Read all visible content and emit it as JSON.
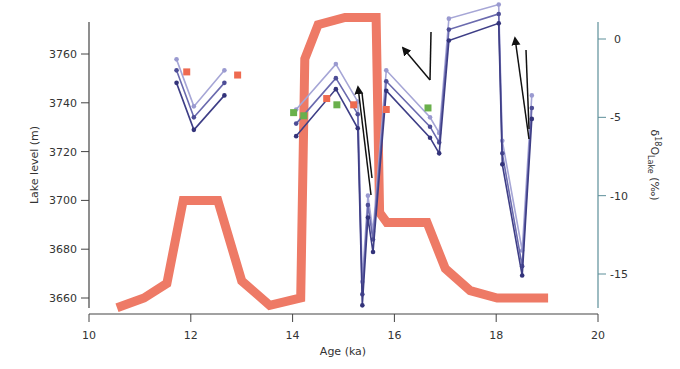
{
  "chart_data": {
    "type": "line",
    "title": "",
    "xlabel": "Age (ka)",
    "ylabel_left": "Lake level (m)",
    "ylabel_right": "δ18O_Lake (‰)",
    "ylabel_right_parts": {
      "delta": "δ",
      "sup": "18",
      "main": "O",
      "sub": "Lake",
      "unit": " (‰)"
    },
    "xlim": [
      10,
      20
    ],
    "ylim_left": [
      3652,
      3774
    ],
    "ylim_right": [
      -17.5,
      1.2
    ],
    "grid": false,
    "x_ticks": [
      10,
      12,
      14,
      16,
      18,
      20
    ],
    "y_ticks_left": [
      3660,
      3680,
      3700,
      3720,
      3740,
      3760
    ],
    "y_ticks_right": [
      0,
      -5,
      -10,
      -15
    ],
    "colors": {
      "lake_level": "#ee7a66",
      "model_light": "#a6a6d6",
      "model_mid": "#6a6aae",
      "model_dark": "#3e3e86",
      "obs_red": "#ee6a50",
      "obs_green": "#6ab04c",
      "arrow": "#111111",
      "axis": "#444444",
      "right_axis": "#5d8f99"
    },
    "series": [
      {
        "name": "Lake level",
        "axis": "left",
        "style": "thick-line",
        "x": [
          10.55,
          11.08,
          11.53,
          11.85,
          12.53,
          13.0,
          13.55,
          14.16,
          14.24,
          14.5,
          15.03,
          15.64,
          15.71,
          15.85,
          16.64,
          17.0,
          17.49,
          18.02,
          19.02
        ],
        "values": [
          3656,
          3660,
          3666,
          3700,
          3700,
          3667,
          3657,
          3660,
          3758,
          3772,
          3775,
          3775,
          3695,
          3691,
          3691,
          3672,
          3663,
          3660,
          3660
        ]
      },
      {
        "name": "Modeled δ18O (scenario A, light)",
        "axis": "right",
        "style": "line-dots",
        "segments": [
          {
            "x": [
              11.72,
              12.06,
              12.66
            ],
            "values": [
              -1.3,
              -4.3,
              -2.0
            ]
          },
          {
            "x": [
              14.07,
              14.85,
              15.28,
              15.37,
              15.48,
              15.58,
              15.84,
              16.7,
              16.88,
              17.07,
              18.05,
              18.12,
              18.51,
              18.7
            ],
            "values": [
              -4.5,
              -1.6,
              -4.0,
              -15.5,
              -10.0,
              -12.3,
              -2.0,
              -5.0,
              -6.0,
              1.3,
              2.2,
              -6.5,
              -13.5,
              -3.6
            ]
          }
        ]
      },
      {
        "name": "Modeled δ18O (scenario B, mid)",
        "axis": "right",
        "style": "line-dots",
        "segments": [
          {
            "x": [
              11.72,
              12.06,
              12.66
            ],
            "values": [
              -2.0,
              -5.0,
              -2.8
            ]
          },
          {
            "x": [
              14.07,
              14.85,
              15.28,
              15.37,
              15.48,
              15.58,
              15.84,
              16.7,
              16.88,
              17.07,
              18.05,
              18.12,
              18.51,
              18.7
            ],
            "values": [
              -5.4,
              -2.5,
              -4.8,
              -16.3,
              -10.6,
              -12.8,
              -2.7,
              -5.6,
              -6.6,
              0.6,
              1.6,
              -7.3,
              -14.5,
              -4.4
            ]
          }
        ]
      },
      {
        "name": "Modeled δ18O (scenario C, dark)",
        "axis": "right",
        "style": "line-dots",
        "segments": [
          {
            "x": [
              11.72,
              12.06,
              12.66
            ],
            "values": [
              -2.8,
              -5.8,
              -3.6
            ]
          },
          {
            "x": [
              14.07,
              14.85,
              15.28,
              15.37,
              15.48,
              15.58,
              15.84,
              16.7,
              16.88,
              17.07,
              18.05,
              18.12,
              18.51,
              18.7
            ],
            "values": [
              -6.2,
              -3.2,
              -5.7,
              -17.0,
              -11.4,
              -13.6,
              -3.3,
              -6.3,
              -7.3,
              -0.1,
              1.0,
              -8.0,
              -15.1,
              -5.1
            ]
          }
        ]
      },
      {
        "name": "Observed δ18O (red squares)",
        "axis": "right",
        "style": "square-markers",
        "x": [
          11.92,
          12.92,
          14.67,
          15.2,
          15.84
        ],
        "values": [
          -2.1,
          -2.3,
          -3.8,
          -4.2,
          -4.5
        ]
      },
      {
        "name": "Observed δ18O (green squares)",
        "axis": "right",
        "style": "square-markers",
        "x": [
          14.02,
          14.22,
          14.87,
          16.66
        ],
        "values": [
          -4.7,
          -4.9,
          -4.2,
          -4.4
        ]
      }
    ],
    "annotations": [
      {
        "type": "arrow",
        "from_xy_px": [
          371,
          195
        ],
        "to_xy_px": [
          358,
          87
        ],
        "label": ""
      },
      {
        "type": "line",
        "from_xy_px": [
          362,
          93
        ],
        "to_xy_px": [
          372,
          178
        ],
        "label": ""
      },
      {
        "type": "arrow",
        "from_xy_px": [
          430,
          80
        ],
        "to_xy_px": [
          403,
          48
        ],
        "label": ""
      },
      {
        "type": "line",
        "from_xy_px": [
          430,
          80
        ],
        "to_xy_px": [
          431,
          32
        ],
        "label": ""
      },
      {
        "type": "arrow",
        "from_xy_px": [
          529,
          139
        ],
        "to_xy_px": [
          515,
          38
        ],
        "label": ""
      },
      {
        "type": "line",
        "from_xy_px": [
          526,
          50
        ],
        "to_xy_px": [
          529,
          129
        ],
        "label": ""
      }
    ]
  },
  "axes": {
    "x_label": "Age (ka)",
    "left_label": "Lake level (m)",
    "x_tick_labels": [
      "10",
      "12",
      "14",
      "16",
      "18",
      "20"
    ],
    "left_tick_labels": [
      "3660",
      "3680",
      "3700",
      "3720",
      "3740",
      "3760"
    ],
    "right_tick_labels": [
      "0",
      "-5",
      "-10",
      "-15"
    ]
  }
}
